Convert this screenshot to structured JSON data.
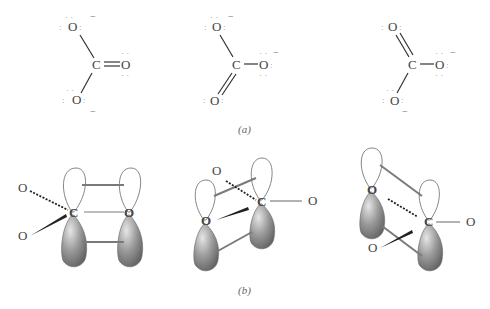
{
  "figure": {
    "panel_a": {
      "caption": "(a)",
      "structures": [
        {
          "id": "resonance-1",
          "carbon": "C",
          "oxygens": [
            {
              "position": "top",
              "label": "O",
              "bond": "single",
              "lone_pairs": ":O:",
              "charge": "−"
            },
            {
              "position": "right",
              "label": "O",
              "bond": "double",
              "lone_pairs": "O",
              "charge": ""
            },
            {
              "position": "bottom",
              "label": "O",
              "bond": "single",
              "lone_pairs": ":O:",
              "charge": "−"
            }
          ]
        },
        {
          "id": "resonance-2",
          "carbon": "C",
          "oxygens": [
            {
              "position": "top",
              "label": "O",
              "bond": "single",
              "lone_pairs": ":O:",
              "charge": "−"
            },
            {
              "position": "right",
              "label": "O",
              "bond": "single",
              "lone_pairs": ":O:",
              "charge": "−"
            },
            {
              "position": "bottom",
              "label": "O",
              "bond": "double",
              "lone_pairs": ":O",
              "charge": ""
            }
          ]
        },
        {
          "id": "resonance-3",
          "carbon": "C",
          "oxygens": [
            {
              "position": "top",
              "label": "O",
              "bond": "double",
              "lone_pairs": ":O",
              "charge": ""
            },
            {
              "position": "right",
              "label": "O",
              "bond": "single",
              "lone_pairs": ":O:",
              "charge": "−"
            },
            {
              "position": "bottom",
              "label": "O",
              "bond": "single",
              "lone_pairs": ":O:",
              "charge": "−"
            }
          ]
        }
      ]
    },
    "panel_b": {
      "caption": "(b)",
      "orbital_diagrams": [
        {
          "id": "pi-overlap-1",
          "carbon": "C",
          "overlap_oxygen": "O",
          "substituents": [
            "O",
            "O"
          ]
        },
        {
          "id": "pi-overlap-2",
          "carbon": "C",
          "overlap_oxygen": "O",
          "substituents": [
            "O",
            "O"
          ]
        },
        {
          "id": "pi-overlap-3",
          "carbon": "C",
          "overlap_oxygen": "O",
          "substituents": [
            "O",
            "O"
          ]
        }
      ]
    },
    "colors": {
      "lobe_shaded": "#8a8a8a",
      "lobe_outline": "#777777",
      "bond": "#333333",
      "overlap_line": "#7a7a7a",
      "text": "#444444"
    }
  }
}
